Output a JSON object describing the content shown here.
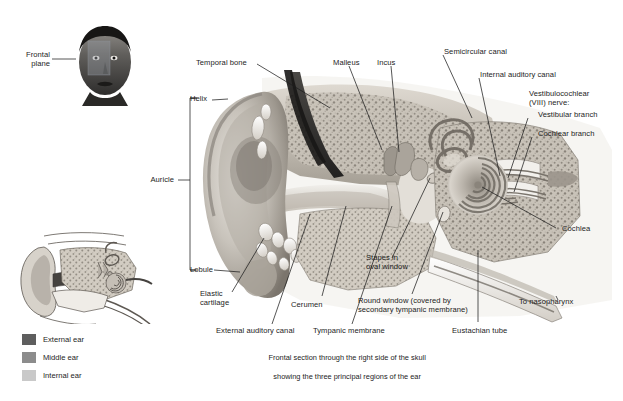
{
  "figure": {
    "background": "#ffffff",
    "caption": {
      "line1": "Frontal section through the right side of the skull",
      "line2": "showing the three principal regions of the ear"
    }
  },
  "insets": {
    "head": {
      "name": "frontal-plane-head",
      "label_line1": "Frontal",
      "label_line2": "plane"
    },
    "ear_overview": {
      "name": "ear-overview-inset"
    }
  },
  "legend": {
    "items": [
      {
        "label": "External ear",
        "color": "#5e5e5e"
      },
      {
        "label": "Middle ear",
        "color": "#8c8c8c"
      },
      {
        "label": "Internal ear",
        "color": "#c9c9c9"
      }
    ]
  },
  "brackets": {
    "auricle": "Auricle"
  },
  "labels": {
    "helix": "Helix",
    "auricle": "Auricle",
    "lobule": "Lobule",
    "temporal_bone": "Temporal bone",
    "malleus": "Malleus",
    "incus": "Incus",
    "semicircular_canal": "Semicircular canal",
    "internal_auditory_canal": "Internal auditory canal",
    "vestibulocochlear_l1": "Vestibulocochlear",
    "vestibulocochlear_l2": "(VIII) nerve:",
    "vestibular_branch": "Vestibular branch",
    "cochlear_branch": "Cochlear branch",
    "cochlea": "Cochlea",
    "to_nasopharynx": "To nasopharynx",
    "elastic_cartilage_l1": "Elastic",
    "elastic_cartilage_l2": "cartilage",
    "cerumen": "Cerumen",
    "external_auditory_canal": "External auditory canal",
    "tympanic_membrane": "Tympanic membrane",
    "stapes_l1": "Stapes in",
    "stapes_l2": "oval window",
    "round_window_l1": "Round window (covered by",
    "round_window_l2": "secondary tympanic membrane)",
    "eustachian_tube": "Eustachian tube"
  },
  "colors": {
    "leader_line": "#1d1d1d",
    "text": "#1c1c1c",
    "tissue_light": "#d8d4cd",
    "tissue_mid": "#a9a49c",
    "tissue_dark": "#6f6a63",
    "bone": "#cfc9c0",
    "canal_dark": "#3c3a37"
  }
}
